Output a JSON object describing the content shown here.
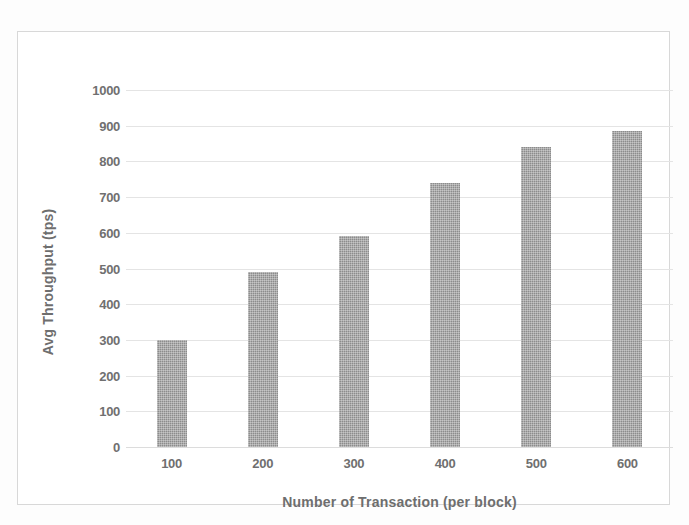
{
  "figure": {
    "kind": "scanned-bar-chart",
    "frame_color": "#d8d8d8",
    "background_color": "#ffffff"
  },
  "chart_data": {
    "type": "bar",
    "title": "",
    "xlabel": "Number of Transaction (per block)",
    "ylabel": "Avg Throughput (tps)",
    "categories": [
      "100",
      "200",
      "300",
      "400",
      "500",
      "600"
    ],
    "values": [
      300,
      490,
      590,
      740,
      840,
      885
    ],
    "ylim": [
      0,
      1000
    ],
    "yticks": [
      "1000",
      "900",
      "800",
      "700",
      "600",
      "500",
      "400",
      "300",
      "200",
      "100",
      "0"
    ],
    "ytick_values": [
      1000,
      900,
      800,
      700,
      600,
      500,
      400,
      300,
      200,
      100,
      0
    ],
    "grid": true,
    "grid_color": "#e4e4e4",
    "legend": null,
    "legend_position": "none",
    "bar_color": "#8c8c8c",
    "series": [
      {
        "name": "Avg Throughput (tps)",
        "values": [
          300,
          490,
          590,
          740,
          840,
          885
        ]
      }
    ]
  }
}
